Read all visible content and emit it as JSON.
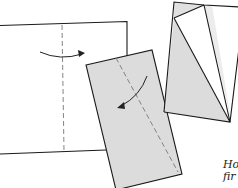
{
  "figure": {
    "colors": {
      "paper_white": "#ffffff",
      "paper_grey": "#dcdcdc",
      "paper_grey_light": "#e8e8e8",
      "outline": "#1a1a1a",
      "fold_line": "#777777"
    },
    "steps": [
      {
        "id": "step-1",
        "description": "Sheet with vertical valley fold line and arrow folding right"
      },
      {
        "id": "step-2",
        "description": "Grey rectangle with diagonal fold line and curved arrow"
      },
      {
        "id": "step-3",
        "description": "Folded kite-shaped result with grey and white flaps"
      }
    ]
  },
  "caption": {
    "line1": "Ho",
    "line2": "fir"
  }
}
